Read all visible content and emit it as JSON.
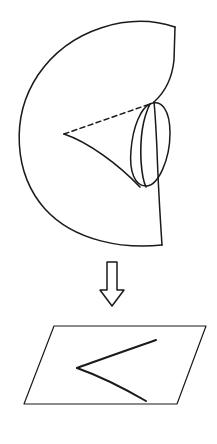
{
  "figure": {
    "background_color": "#ffffff",
    "ink_color": "#1a1a1a",
    "stroke_width": 1.4,
    "width": 217,
    "height": 444
  },
  "upper_panel": {
    "name": "cusp-surface-3d",
    "label": "",
    "elements": [
      {
        "name": "surface-outer-boundary",
        "kind": "closed-curve",
        "style": "solid",
        "path": "M 175 27 C 130 12, 70 28, 38 75 C 10 117, 14 174, 45 209 C 75 242, 125 249, 162 245"
      },
      {
        "name": "surface-right-edge",
        "kind": "curve",
        "style": "solid",
        "path": "M 175 27 L 174 60 C 172 80, 164 93, 154 102"
      },
      {
        "name": "surface-right-lower-edge",
        "kind": "curve",
        "style": "solid",
        "path": "M 162 245 C 160 215, 158 180, 157 150 C 156 128, 155 112, 154 102"
      },
      {
        "name": "fold-loop",
        "kind": "closed-loop",
        "style": "solid",
        "path": "M 150 104 C 162 99, 170 111, 170 133 C 170 160, 158 186, 146 186 C 135 186, 129 172, 131 150 C 133 126, 141 108, 150 104 Z"
      },
      {
        "name": "cusp-edge-hidden",
        "kind": "curve",
        "style": "dashed",
        "path": "M 64 134 L 150 104"
      },
      {
        "name": "cusp-edge-visible-lower",
        "kind": "curve",
        "style": "solid",
        "path": "M 64 134 C 88 142, 118 164, 140 187"
      },
      {
        "name": "fold-crease-upper",
        "kind": "curve",
        "style": "solid",
        "path": "M 150 104 C 143 118, 140 140, 141 161 C 142 175, 144 183, 146 187"
      }
    ]
  },
  "arrow": {
    "name": "projection-arrow",
    "direction": "down",
    "style": "hollow-outline",
    "label": "",
    "path": "M 107 262 L 117 262 L 117 290 L 124 290 L 112 306 L 100 290 L 107 290 Z"
  },
  "lower_panel": {
    "name": "projection-plane",
    "label": "",
    "parallelogram": {
      "name": "plane-parallelogram",
      "corners": [
        [
          54,
          326
        ],
        [
          206,
          326
        ],
        [
          177,
          404
        ],
        [
          24,
          404
        ]
      ]
    },
    "cusp_curve": {
      "name": "cusp-discriminant-curve",
      "vertex": [
        77,
        368
      ],
      "upper_branch_end": [
        156,
        340
      ],
      "lower_branch_end": [
        146,
        401
      ],
      "upper_path": "M 77 368 C 96 361, 122 352, 156 340",
      "lower_path": "M 77 368 C 94 374, 120 386, 146 401"
    }
  }
}
